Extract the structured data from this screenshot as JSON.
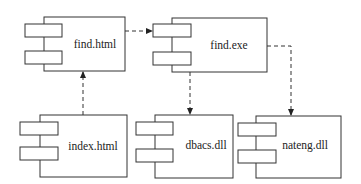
{
  "diagram": {
    "type": "UML component diagram",
    "components": [
      {
        "id": "find_html",
        "label": "find.html"
      },
      {
        "id": "find_exe",
        "label": "find.exe"
      },
      {
        "id": "index_html",
        "label": "index.html"
      },
      {
        "id": "dbacs_dll",
        "label": "dbacs.dll"
      },
      {
        "id": "nateng_dll",
        "label": "nateng.dll"
      }
    ],
    "dependencies": [
      {
        "from": "index.html",
        "to": "find.html",
        "style": "dashed-arrow"
      },
      {
        "from": "find.html",
        "to": "find.exe",
        "style": "dashed-arrow"
      },
      {
        "from": "find.exe",
        "to": "dbacs.dll",
        "style": "dashed-arrow"
      },
      {
        "from": "find.exe",
        "to": "nateng.dll",
        "style": "dashed-arrow"
      }
    ],
    "colors": {
      "stroke": "#333333",
      "background": "#ffffff",
      "text": "#222222"
    }
  }
}
